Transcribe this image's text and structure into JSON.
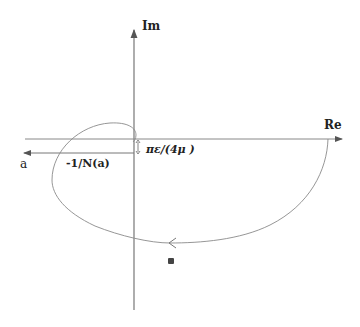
{
  "diagram": {
    "type": "nyquist-plot-describing-function",
    "axes": {
      "imaginary_label": "Im",
      "real_label": "Re"
    },
    "locus": {
      "direction_label": "a",
      "label": "-1/N(a)"
    },
    "offset_label": "πε/(4μ )",
    "colors": {
      "axis": "#777777",
      "curve": "#888888",
      "text": "#222222",
      "marker": "#444444"
    }
  }
}
